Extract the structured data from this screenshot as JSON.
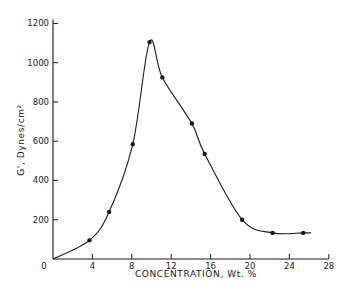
{
  "chart_data": {
    "type": "line",
    "title": "",
    "xlabel": "CONCENTRATION, Wt. %",
    "ylabel": "G', Dynes/cm²",
    "xlim": [
      0,
      28
    ],
    "ylim": [
      0,
      1200
    ],
    "xticks": [
      4,
      8,
      12,
      16,
      20,
      24,
      28
    ],
    "yticks": [
      200,
      400,
      600,
      800,
      1000,
      1200
    ],
    "xtick_labels": [
      "4",
      "8",
      "12",
      "16",
      "20",
      "24",
      "28"
    ],
    "ytick_labels": [
      "200",
      "400",
      "600",
      "800",
      "1000",
      "1200"
    ],
    "origin_label": "0",
    "grid": false,
    "legend": null,
    "series": [
      {
        "name": "G'",
        "markers": true,
        "points": [
          {
            "x": 3.7,
            "y": 95
          },
          {
            "x": 5.7,
            "y": 240
          },
          {
            "x": 8.1,
            "y": 585
          },
          {
            "x": 9.8,
            "y": 1105
          },
          {
            "x": 11.1,
            "y": 925
          },
          {
            "x": 14.1,
            "y": 690
          },
          {
            "x": 15.4,
            "y": 535
          },
          {
            "x": 19.2,
            "y": 200
          },
          {
            "x": 22.3,
            "y": 133
          },
          {
            "x": 25.4,
            "y": 133
          }
        ],
        "curve_start": {
          "x": 0,
          "y": 0
        },
        "curve_end": {
          "x": 26.2,
          "y": 133
        }
      }
    ]
  },
  "colors": {
    "ink": "#1a1a1a",
    "background": "#ffffff"
  }
}
